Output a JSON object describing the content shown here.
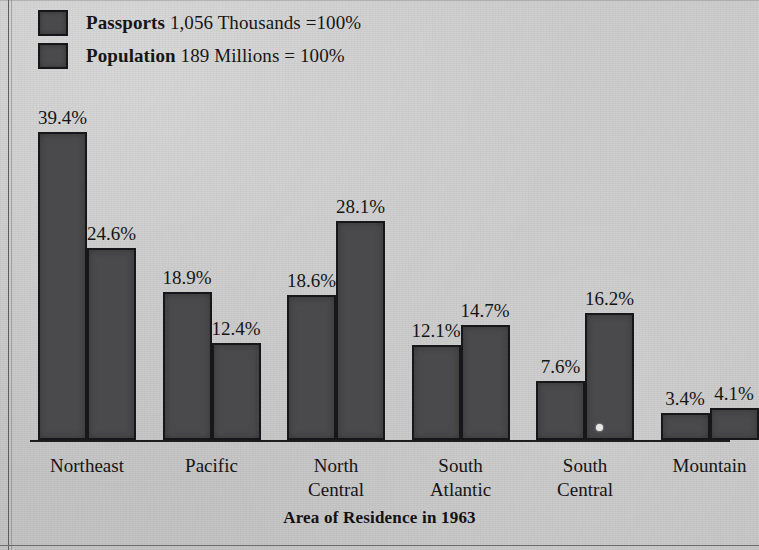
{
  "legend": {
    "items": [
      {
        "swatch": "series-swatch",
        "name": "Passports",
        "value": "1,056 Thousands =100%"
      },
      {
        "swatch": "series-swatch",
        "name": "Population",
        "value": "189 Millions = 100%"
      }
    ]
  },
  "axis_title": "Area of Residence in 1963",
  "colors": {
    "paper": "#c9c9c9",
    "bar_fill": "#4a4a4c",
    "bar_outline": "#17171b",
    "text": "#151515"
  },
  "chart_data": {
    "type": "bar",
    "title": "",
    "xlabel": "Area of Residence in 1963",
    "ylabel": "",
    "ylim": [
      0,
      39.4
    ],
    "grid": false,
    "legend_position": "top-left",
    "categories": [
      "Northeast",
      "Pacific",
      "North\nCentral",
      "South\nAtlantic",
      "South\nCentral",
      "Mountain"
    ],
    "series": [
      {
        "name": "Passports",
        "note": "1,056 Thousands =100%",
        "values": [
          39.4,
          18.9,
          18.6,
          12.1,
          7.6,
          3.4
        ],
        "labels": [
          "39.4%",
          "18.9%",
          "18.6%",
          "12.1%",
          "7.6%",
          "3.4%"
        ]
      },
      {
        "name": "Population",
        "note": "189 Millions = 100%",
        "values": [
          24.6,
          12.4,
          28.1,
          14.7,
          16.2,
          4.1
        ],
        "labels": [
          "24.6%",
          "12.4%",
          "28.1%",
          "14.7%",
          "16.2%",
          "4.1%"
        ]
      }
    ]
  }
}
